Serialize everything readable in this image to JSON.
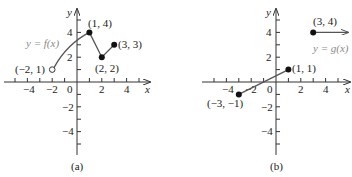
{
  "figure": {
    "panels": [
      {
        "id": "a",
        "caption": "(a)",
        "function_label": "y = f(x)",
        "x_axis_label": "x",
        "y_axis_label": "y",
        "x_ticks": [
          "−4",
          "−2",
          "0",
          "2",
          "4"
        ],
        "y_ticks": [
          "4",
          "2",
          "−2",
          "−4"
        ],
        "points": [
          {
            "label": "(−2, 1)",
            "x": -2,
            "y": 1,
            "filled": false
          },
          {
            "label": "(1, 4)",
            "x": 1,
            "y": 4,
            "filled": true
          },
          {
            "label": "(2, 2)",
            "x": 2,
            "y": 2,
            "filled": true
          },
          {
            "label": "(3, 3)",
            "x": 3,
            "y": 3,
            "filled": true
          }
        ]
      },
      {
        "id": "b",
        "caption": "(b)",
        "function_label": "y = g(x)",
        "x_axis_label": "x",
        "y_axis_label": "y",
        "x_ticks": [
          "−4",
          "−2",
          "0",
          "2",
          "4"
        ],
        "y_ticks": [
          "4",
          "2",
          "−2",
          "−4"
        ],
        "points": [
          {
            "label": "(−3, −1)",
            "x": -3,
            "y": -1,
            "filled": true
          },
          {
            "label": "(1, 1)",
            "x": 1,
            "y": 1,
            "filled": true
          },
          {
            "label": "(3, 4)",
            "x": 3,
            "y": 4,
            "filled": true
          }
        ]
      }
    ],
    "colors": {
      "axis": "#333333",
      "curve": "#555555",
      "function_label": "#8a8a8a"
    }
  }
}
